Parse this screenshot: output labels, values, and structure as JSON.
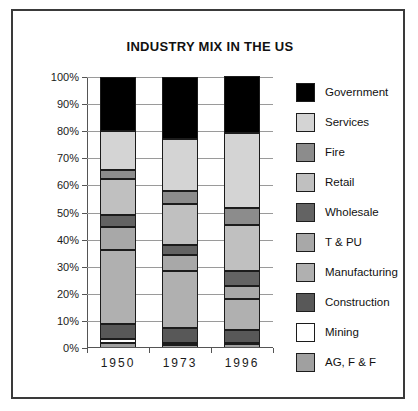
{
  "chart_data": {
    "type": "bar",
    "subtype": "stacked-percentage-column",
    "title": "INDUSTRY MIX IN THE US",
    "xlabel": "",
    "ylabel": "",
    "categories": [
      "1950",
      "1973",
      "1996"
    ],
    "ylim": [
      0,
      100
    ],
    "ytick_labels": [
      "0%",
      "10%",
      "20%",
      "30%",
      "40%",
      "50%",
      "60%",
      "70%",
      "80%",
      "90%",
      "100%"
    ],
    "ytick_values": [
      0,
      10,
      20,
      30,
      40,
      50,
      60,
      70,
      80,
      90,
      100
    ],
    "grid": true,
    "legend_position": "right",
    "stack_order_bottom_to_top": [
      "AG, F & F",
      "Mining",
      "Construction",
      "Manufacturing",
      "T & PU",
      "Wholesale",
      "Retail",
      "Fire",
      "Services",
      "Government"
    ],
    "series": [
      {
        "name": "Government",
        "color": "#000000",
        "values": [
          20.0,
          23.0,
          21.0
        ]
      },
      {
        "name": "Services",
        "color": "#d4d4d4",
        "values": [
          14.5,
          19.0,
          28.0
        ]
      },
      {
        "name": "Fire",
        "color": "#8c8c8c",
        "values": [
          3.0,
          5.0,
          6.0
        ]
      },
      {
        "name": "Retail",
        "color": "#c0c0c0",
        "values": [
          13.5,
          15.0,
          17.0
        ]
      },
      {
        "name": "Wholesale",
        "color": "#636363",
        "values": [
          4.5,
          3.5,
          5.5
        ]
      },
      {
        "name": "T & PU",
        "color": "#a8a8a8",
        "values": [
          8.5,
          6.0,
          5.0
        ]
      },
      {
        "name": "Manufacturing",
        "color": "#b0b0b0",
        "values": [
          27.0,
          21.0,
          11.5
        ]
      },
      {
        "name": "Construction",
        "color": "#585858",
        "values": [
          5.5,
          5.5,
          4.5
        ]
      },
      {
        "name": "Mining",
        "color": "#ffffff",
        "values": [
          1.5,
          1.0,
          0.5
        ]
      },
      {
        "name": "AG, F & F",
        "color": "#a0a0a0",
        "values": [
          2.0,
          1.0,
          1.5
        ]
      }
    ]
  },
  "legend": {
    "items": [
      {
        "label": "Government",
        "color": "#000000"
      },
      {
        "label": "Services",
        "color": "#d4d4d4"
      },
      {
        "label": "Fire",
        "color": "#8c8c8c"
      },
      {
        "label": "Retail",
        "color": "#c0c0c0"
      },
      {
        "label": "Wholesale",
        "color": "#636363"
      },
      {
        "label": "T & PU",
        "color": "#a8a8a8"
      },
      {
        "label": "Manufacturing",
        "color": "#b0b0b0"
      },
      {
        "label": "Construction",
        "color": "#585858"
      },
      {
        "label": "Mining",
        "color": "#ffffff"
      },
      {
        "label": "AG, F & F",
        "color": "#a0a0a0"
      }
    ]
  },
  "colors": {
    "frame": "#3a3a3a",
    "axis": "#555555",
    "gridline": "#9a9a9a",
    "segment_border": "#1c1c1c",
    "background": "#ffffff",
    "text": "#111111"
  }
}
